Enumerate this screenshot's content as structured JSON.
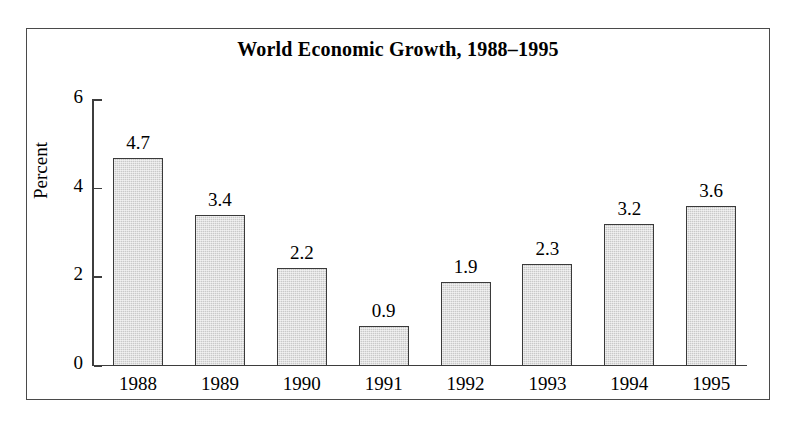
{
  "chart_data": {
    "type": "bar",
    "title": "World Economic Growth, 1988–1995",
    "xlabel": "",
    "ylabel": "Percent",
    "categories": [
      "1988",
      "1989",
      "1990",
      "1991",
      "1992",
      "1993",
      "1994",
      "1995"
    ],
    "values": [
      4.7,
      3.4,
      2.2,
      0.9,
      1.9,
      2.3,
      3.2,
      3.6
    ],
    "value_labels": [
      "4.7",
      "3.4",
      "2.2",
      "0.9",
      "1.9",
      "2.3",
      "3.2",
      "3.6"
    ],
    "ylim": [
      0,
      6
    ],
    "yticks": [
      0,
      2,
      4,
      6
    ],
    "ytick_labels": [
      "0",
      "2",
      "4",
      "6"
    ],
    "grid": false,
    "legend": false,
    "bar_color": "#c9c9c9",
    "bar_edge_color": "#3a3a3a",
    "axis_color": "#3d3d3d",
    "frame_color": "#4a4a4a",
    "background_color": "#ffffff",
    "text_color": "#000000"
  }
}
